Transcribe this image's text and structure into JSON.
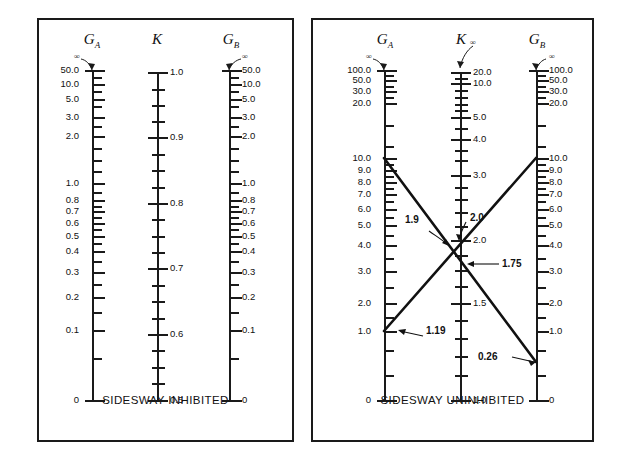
{
  "figure": {
    "type": "nomograph"
  },
  "panels": [
    {
      "id": "sidesway-inhibited",
      "caption": "SIDESWAY INHIBITED",
      "scales": [
        {
          "id": "GA",
          "name": "G",
          "subscript": "A",
          "infinity_mark": "∞",
          "top_value": "50.0",
          "bottom_value": "0",
          "labels": [
            "50.0",
            "10.0",
            "5.0",
            "3.0",
            "2.0",
            "1.0",
            "0.8",
            "0.7",
            "0.6",
            "0.5",
            "0.4",
            "0.3",
            "0.2",
            "0.1",
            "0"
          ]
        },
        {
          "id": "K",
          "name": "K",
          "subscript": "",
          "infinity_mark": "",
          "top_value": "1.0",
          "bottom_value": "0.5",
          "labels": [
            "1.0",
            "0.9",
            "0.8",
            "0.7",
            "0.6",
            "0.5"
          ]
        },
        {
          "id": "GB",
          "name": "G",
          "subscript": "B",
          "infinity_mark": "∞",
          "top_value": "50.0",
          "bottom_value": "0",
          "labels": [
            "50.0",
            "10.0",
            "5.0",
            "3.0",
            "2.0",
            "1.0",
            "0.8",
            "0.7",
            "0.6",
            "0.5",
            "0.4",
            "0.3",
            "0.2",
            "0.1",
            "0"
          ]
        }
      ],
      "annotations": []
    },
    {
      "id": "sidesway-uninhibited",
      "caption": "SIDESWAY UNINHIBITED",
      "scales": [
        {
          "id": "GA",
          "name": "G",
          "subscript": "A",
          "infinity_mark": "∞",
          "top_value": "100.0",
          "bottom_value": "0",
          "labels": [
            "100.0",
            "50.0",
            "30.0",
            "20.0",
            "10.0",
            "9.0",
            "8.0",
            "7.0",
            "6.0",
            "5.0",
            "4.0",
            "3.0",
            "2.0",
            "1.0",
            "0"
          ]
        },
        {
          "id": "K",
          "name": "K",
          "subscript": "",
          "infinity_mark": "∞",
          "top_value": "20.0",
          "bottom_value": "1.0",
          "labels": [
            "20.0",
            "10.0",
            "5.0",
            "4.0",
            "3.0",
            "2.0",
            "1.5",
            "1.0"
          ]
        },
        {
          "id": "GB",
          "name": "G",
          "subscript": "B",
          "infinity_mark": "∞",
          "top_value": "100.0",
          "bottom_value": "0",
          "labels": [
            "100.0",
            "50.0",
            "30.0",
            "20.0",
            "10.0",
            "9.0",
            "8.0",
            "7.0",
            "6.0",
            "5.0",
            "4.0",
            "3.0",
            "2.0",
            "1.0",
            "0"
          ]
        }
      ],
      "annotations": [
        {
          "id": "ga-1p19",
          "label": "1.19",
          "scale": "GA",
          "value": 1.19
        },
        {
          "id": "k-1p9",
          "label": "1.9",
          "scale": "K",
          "value": 1.9
        },
        {
          "id": "k-2p0-tick",
          "label": "2.0",
          "scale": "K",
          "value": 2.0
        },
        {
          "id": "k-1p75",
          "label": "1.75",
          "scale": "K",
          "value": 1.75
        },
        {
          "id": "gb-0p26",
          "label": "0.26",
          "scale": "GB",
          "value": 0.26
        }
      ]
    }
  ],
  "chart_data": {
    "type": "line",
    "panels": [
      {
        "name": "SIDESWAY INHIBITED",
        "axes": [
          {
            "name": "G_A",
            "ticks": [
              50.0,
              10.0,
              5.0,
              3.0,
              2.0,
              1.0,
              0.8,
              0.7,
              0.6,
              0.5,
              0.4,
              0.3,
              0.2,
              0.1,
              0.0
            ],
            "range": [
              0,
              "inf"
            ]
          },
          {
            "name": "K",
            "ticks": [
              1.0,
              0.9,
              0.8,
              0.7,
              0.6,
              0.5
            ],
            "range": [
              0.5,
              1.0
            ]
          },
          {
            "name": "G_B",
            "ticks": [
              50.0,
              10.0,
              5.0,
              3.0,
              2.0,
              1.0,
              0.8,
              0.7,
              0.6,
              0.5,
              0.4,
              0.3,
              0.2,
              0.1,
              0.0
            ],
            "range": [
              0,
              "inf"
            ]
          }
        ],
        "series": []
      },
      {
        "name": "SIDESWAY UNINHIBITED",
        "axes": [
          {
            "name": "G_A",
            "ticks": [
              100.0,
              50.0,
              30.0,
              20.0,
              10.0,
              9.0,
              8.0,
              7.0,
              6.0,
              5.0,
              4.0,
              3.0,
              2.0,
              1.0,
              0.0
            ],
            "range": [
              0,
              "inf"
            ]
          },
          {
            "name": "K",
            "ticks": [
              20.0,
              10.0,
              5.0,
              4.0,
              3.0,
              2.0,
              1.5,
              1.0
            ],
            "range": [
              1.0,
              "inf"
            ]
          },
          {
            "name": "G_B",
            "ticks": [
              100.0,
              50.0,
              30.0,
              20.0,
              10.0,
              9.0,
              8.0,
              7.0,
              6.0,
              5.0,
              4.0,
              3.0,
              2.0,
              1.0,
              0.0
            ],
            "range": [
              0,
              "inf"
            ]
          }
        ],
        "series": [
          {
            "name": "line-1",
            "points": [
              {
                "axis": "G_A",
                "value": 10.0
              },
              {
                "axis": "K",
                "value": 1.9
              },
              {
                "axis": "G_B",
                "value": 0.26
              }
            ]
          },
          {
            "name": "line-2",
            "points": [
              {
                "axis": "G_A",
                "value": 1.19
              },
              {
                "axis": "K",
                "value": 1.75
              },
              {
                "axis": "G_B",
                "value": 10.0
              }
            ]
          }
        ],
        "annotations": [
          "1.9",
          "2.0",
          "1.75",
          "1.19",
          "0.26"
        ]
      }
    ],
    "grid": false,
    "legend": "none"
  }
}
